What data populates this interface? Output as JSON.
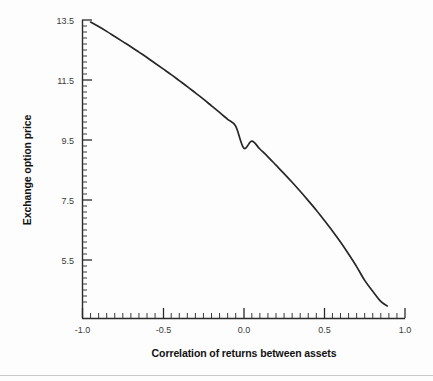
{
  "chart_data": {
    "type": "line",
    "title": "",
    "xlabel": "Correlation of returns between assets",
    "ylabel": "Exchange option price",
    "xlim": [
      -1.0,
      1.0
    ],
    "ylim": [
      3.9,
      13.5
    ],
    "grid": false,
    "legend": null,
    "x_ticks": [
      -1.0,
      -0.5,
      0.0,
      0.5,
      1.0
    ],
    "x_tick_labels": [
      "-1.0",
      "-0.5",
      "0.0",
      "0.5",
      "1.0"
    ],
    "x_minor_step": 0.05,
    "y_ticks": [
      5.5,
      7.5,
      9.5,
      11.5,
      13.5
    ],
    "y_tick_labels": [
      "5.5",
      "7.5",
      "9.5",
      "11.5",
      "13.5"
    ],
    "y_minor_step": 0.2,
    "series": [
      {
        "name": "Exchange option price",
        "color": "#262626",
        "x": [
          -0.95,
          -0.9,
          -0.85,
          -0.8,
          -0.75,
          -0.7,
          -0.65,
          -0.6,
          -0.55,
          -0.5,
          -0.45,
          -0.4,
          -0.35,
          -0.3,
          -0.25,
          -0.2,
          -0.15,
          -0.1,
          -0.05,
          0.0,
          0.05,
          0.1,
          0.15,
          0.2,
          0.25,
          0.3,
          0.35,
          0.4,
          0.45,
          0.5,
          0.55,
          0.6,
          0.65,
          0.7,
          0.75,
          0.8,
          0.85,
          0.89
        ],
        "y": [
          13.43,
          13.28,
          13.12,
          12.95,
          12.78,
          12.61,
          12.43,
          12.25,
          12.06,
          11.87,
          11.68,
          11.48,
          11.28,
          11.07,
          10.86,
          10.64,
          10.42,
          10.19,
          9.96,
          9.23,
          9.46,
          9.2,
          8.94,
          8.66,
          8.38,
          8.09,
          7.79,
          7.48,
          7.16,
          6.82,
          6.47,
          6.1,
          5.7,
          5.28,
          4.82,
          4.46,
          4.12,
          3.97
        ],
        "x_px": [
          90,
          98,
          106,
          114,
          122,
          131,
          139,
          147,
          155,
          163,
          171,
          180,
          188,
          196,
          204,
          212,
          220,
          228,
          236,
          244,
          253,
          261,
          269,
          277,
          285,
          293,
          301,
          309,
          318,
          326,
          334,
          342,
          350,
          358,
          366,
          374,
          381,
          386
        ],
        "y_px": [
          22,
          27,
          32,
          37,
          42,
          47,
          53,
          58,
          63,
          69,
          75,
          81,
          87,
          93,
          99,
          106,
          112,
          119,
          126,
          148,
          141,
          149,
          157,
          165,
          174,
          182,
          191,
          201,
          210,
          220,
          231,
          242,
          254,
          267,
          281,
          292,
          301,
          306
        ]
      }
    ],
    "annotations": [],
    "curve_path": "M 90,22 C 110,33 135,50 163,69 C 192,90 218,113 244,139 C 266,161 290,186 312,212 C 334,239 356,268 372,289 C 379,298 384,303 386,306",
    "note": "Monotonically decreasing convex-to-concave curve of exchange option price versus correlation of asset returns."
  },
  "axis": {
    "x_title": "Correlation of returns between assets",
    "y_title": "Exchange option price"
  }
}
